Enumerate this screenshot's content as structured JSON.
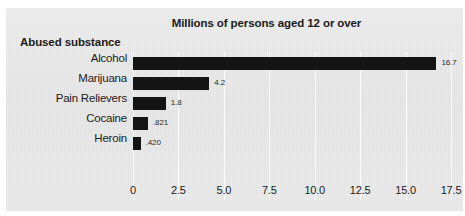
{
  "chart_data": {
    "type": "bar",
    "orientation": "horizontal",
    "title": "Millions of persons aged 12 or over",
    "xlabel": "",
    "ylabel": "Abused substance",
    "categories": [
      "Alcohol",
      "Marijuana",
      "Pain Relievers",
      "Cocaine",
      "Heroin"
    ],
    "values": [
      16.7,
      4.2,
      1.8,
      0.821,
      0.42
    ],
    "value_labels": [
      "16.7",
      "4.2",
      "1.8",
      ".821",
      ".420"
    ],
    "xlim": [
      0,
      17.5
    ],
    "xticks": [
      0,
      2.5,
      5.0,
      7.5,
      10.0,
      12.5,
      15.0,
      17.5
    ],
    "xtick_labels": [
      "0",
      "2.5",
      "5.0",
      "7.5",
      "10.0",
      "12.5",
      "15.0",
      "17.5"
    ],
    "grid": "vertical",
    "legend": null,
    "bar_color": "#141414",
    "background_color": "#e9e9e9",
    "gridline_color": "#fbfbfb"
  }
}
